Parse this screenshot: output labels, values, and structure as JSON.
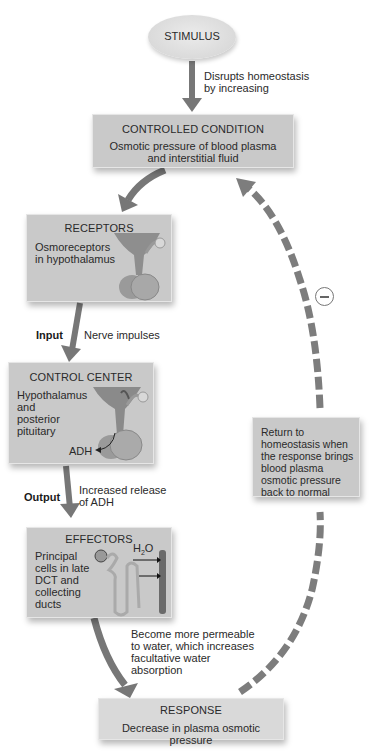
{
  "diagram": {
    "type": "negative-feedback-loop",
    "colors": {
      "box_fill": "#c9c9c9",
      "arrow": "#777777",
      "feedback_arrow": "#7d7d7d",
      "text": "#2a2a2a"
    },
    "stimulus": {
      "label": "STIMULUS",
      "arrow_text": "Disrupts homeostasis\nby increasing"
    },
    "controlled_condition": {
      "title": "CONTROLLED CONDITION",
      "text": "Osmotic pressure of blood plasma\nand interstitial fluid"
    },
    "receptors": {
      "title": "RECEPTORS",
      "text": "Osmoreceptors\nin hypothalamus",
      "icon": "hypothalamus-pituitary-illustration"
    },
    "input": {
      "label": "Input",
      "text": "Nerve impulses"
    },
    "control_center": {
      "title": "CONTROL CENTER",
      "text": "Hypothalamus\nand\nposterior\npituitary",
      "hormone_label": "ADH",
      "icon": "hypothalamus-pituitary-illustration"
    },
    "output": {
      "label": "Output",
      "text": "Increased release\nof ADH"
    },
    "effectors": {
      "title": "EFFECTORS",
      "text": "Principal\ncells in late\nDCT and\ncollecting\nducts",
      "water_label": "H",
      "water_sub": "2",
      "water_label_end": "O",
      "icon": "nephron-collecting-duct-illustration"
    },
    "effector_arrow_text": "Become more permeable\nto water, which increases\nfacultative water\nabsorption",
    "response": {
      "title": "RESPONSE",
      "text": "Decrease in plasma osmotic pressure"
    },
    "feedback": {
      "sign": "negative",
      "sign_icon": "minus-circle-icon",
      "text": "Return to\nhomeostasis when\nthe response brings\nblood plasma\nosmotic pressure\nback to normal"
    }
  }
}
